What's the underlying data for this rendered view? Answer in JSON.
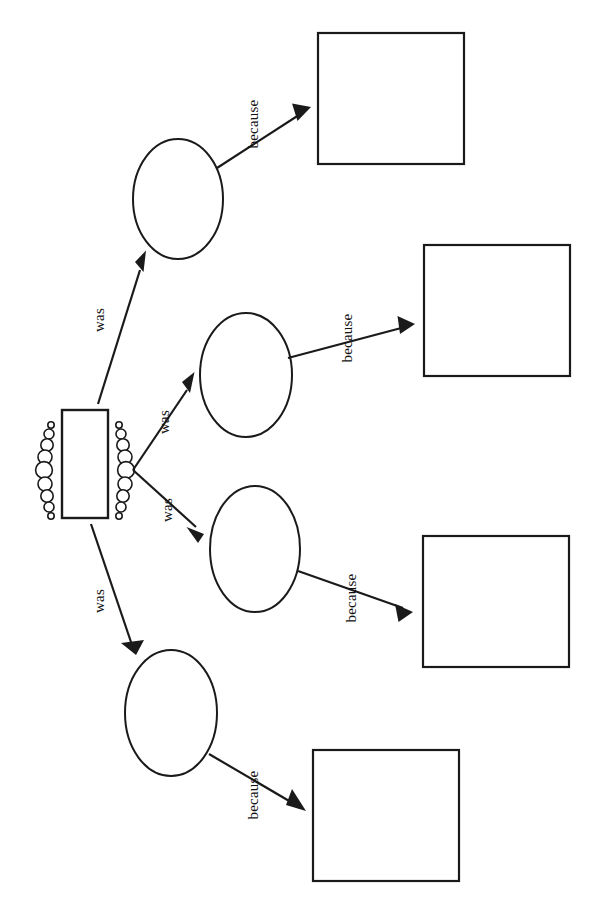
{
  "diagram": {
    "type": "tree",
    "orientation": "rotated-90-clockwise",
    "background_color": "#ffffff",
    "line_color": "#1a1a1a",
    "root": {
      "shape": "rectangle",
      "label": "",
      "decoration": "circle-cluster-both-sides",
      "decoration_circle_count": 9
    },
    "edge_label_was": "was",
    "edge_label_because": "because",
    "branches": [
      {
        "id": "branch-1",
        "relation_label": "was",
        "middle": {
          "shape": "ellipse",
          "label": ""
        },
        "leaf_relation_label": "because",
        "leaf": {
          "shape": "rectangle",
          "label": ""
        }
      },
      {
        "id": "branch-2",
        "relation_label": "was",
        "middle": {
          "shape": "ellipse",
          "label": ""
        },
        "leaf_relation_label": "because",
        "leaf": {
          "shape": "rectangle",
          "label": ""
        }
      },
      {
        "id": "branch-3",
        "relation_label": "was",
        "middle": {
          "shape": "ellipse",
          "label": ""
        },
        "leaf_relation_label": "because",
        "leaf": {
          "shape": "rectangle",
          "label": ""
        }
      },
      {
        "id": "branch-4",
        "relation_label": "was",
        "middle": {
          "shape": "ellipse",
          "label": ""
        },
        "leaf_relation_label": "because",
        "leaf": {
          "shape": "rectangle",
          "label": ""
        }
      }
    ]
  }
}
